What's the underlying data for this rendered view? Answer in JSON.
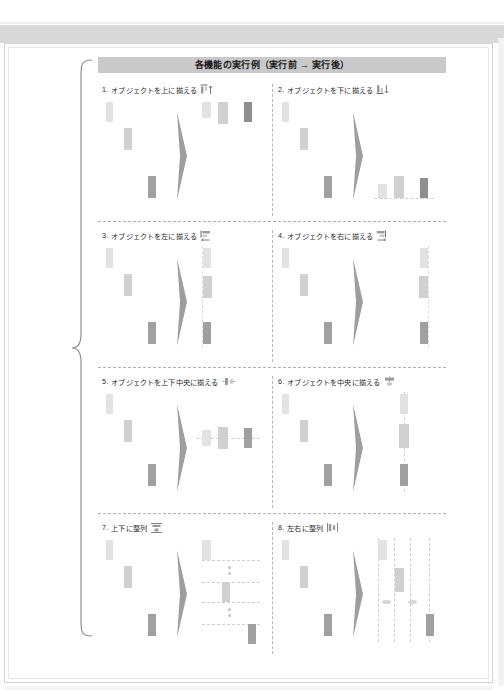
{
  "document": {
    "header_title": "各機能の実行例（実行前 → 実行後）",
    "brace_icon": "left-curly-brace"
  },
  "palette": {
    "header_band": "#c9c9c9",
    "shape_light": "#e2e2e2",
    "shape_mid": "#d0d0d0",
    "shape_dark": "#a0a0a0",
    "shape_darker": "#8e8e8e",
    "guide_dashed": "#cfcfcf",
    "separator": "#b0b0b0",
    "paper_border": "#d3d3d3",
    "text": "#2a2a2a"
  },
  "panels": [
    {
      "number": "1.",
      "label": "オブジェクトを上に揃える",
      "icon": "align-top-icon",
      "arrow_glyph": "↑",
      "arrow_icon": "arrow-up-icon"
    },
    {
      "number": "2.",
      "label": "オブジェクトを下に揃える",
      "icon": "align-bottom-icon",
      "arrow_glyph": "↓",
      "arrow_icon": "arrow-down-icon"
    },
    {
      "number": "3.",
      "label": "オブジェクトを左に揃える",
      "icon": "align-left-icon",
      "arrow_glyph": "←",
      "arrow_icon": "arrow-left-icon"
    },
    {
      "number": "4.",
      "label": "オブジェクトを右に揃える",
      "icon": "align-right-icon",
      "arrow_glyph": "→",
      "arrow_icon": "arrow-right-icon"
    },
    {
      "number": "5.",
      "label": "オブジェクトを上下中央に揃える",
      "icon": "align-middle-icon",
      "arrow_glyph": "",
      "arrow_icon": "align-middle-marker-icon"
    },
    {
      "number": "6.",
      "label": "オブジェクトを中央に揃える",
      "icon": "align-center-icon",
      "arrow_glyph": "",
      "arrow_icon": "align-center-marker-icon"
    },
    {
      "number": "7.",
      "label": "上下に整列",
      "icon": "distribute-vertical-icon",
      "arrow_glyph": "",
      "arrow_icon": "distribute-vertical-marker-icon"
    },
    {
      "number": "8.",
      "label": "左右に整列",
      "icon": "distribute-horizontal-icon",
      "arrow_glyph": "",
      "arrow_icon": "distribute-horizontal-marker-icon"
    }
  ]
}
